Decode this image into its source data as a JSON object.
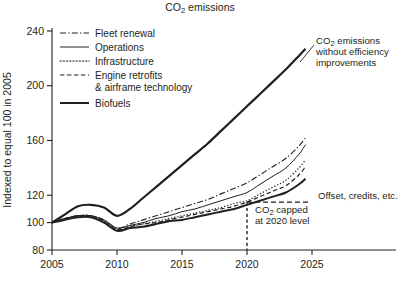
{
  "chart_data": {
    "type": "line",
    "title": "CO2 emissions",
    "title_rich": [
      "CO",
      "2",
      " emissions"
    ],
    "xlabel": "",
    "ylabel": "Indexed to equal 100 in 2005",
    "xlim": [
      2005,
      2025.6
    ],
    "ylim": [
      80,
      243
    ],
    "grid": false,
    "legend_position": "top-left inside plot area",
    "xticks": [
      2005,
      2010,
      2015,
      2020,
      2025
    ],
    "xtick_labels": [
      "2005",
      "2010",
      "2015",
      "2020",
      "2025"
    ],
    "yticks": [
      80,
      100,
      120,
      160,
      200,
      240
    ],
    "ytick_labels": [
      "80",
      "100",
      "120",
      "160",
      "200",
      "240"
    ],
    "x": [
      2005,
      2006,
      2007,
      2008,
      2009,
      2010,
      2011,
      2012,
      2013,
      2014,
      2015,
      2016,
      2017,
      2018,
      2019,
      2020,
      2021,
      2022,
      2023,
      2024,
      2024.5
    ],
    "series": [
      {
        "name": "CO2 emissions without efficiency improvements",
        "short_name": "no-efficiency-baseline",
        "style": "dash-dot-double",
        "width": 2.2,
        "color": "#231f20",
        "values": [
          100,
          106,
          112,
          113,
          111,
          105,
          110,
          118,
          126,
          134,
          142,
          150,
          158,
          167,
          176,
          185,
          194,
          203,
          212,
          222,
          227
        ]
      },
      {
        "name": "Fleet renewal",
        "short_name": "fleet-renewal",
        "style": "dash-dot",
        "width": 1.1,
        "color": "#231f20",
        "values": [
          100,
          103,
          105,
          105,
          102,
          96,
          99,
          102,
          105,
          108,
          111,
          114,
          117,
          121,
          125,
          129,
          135,
          141,
          147,
          156,
          162
        ]
      },
      {
        "name": "Operations",
        "short_name": "operations",
        "style": "solid-thin",
        "width": 1.0,
        "color": "#231f20",
        "values": [
          100,
          103,
          105,
          105,
          102,
          96,
          98,
          100,
          103,
          105,
          108,
          110,
          113,
          116,
          119,
          122,
          128,
          134,
          140,
          150,
          157
        ]
      },
      {
        "name": "Infrastructure",
        "short_name": "infrastructure",
        "style": "dotted",
        "width": 1.2,
        "color": "#231f20",
        "values": [
          100,
          103,
          105,
          105,
          101,
          95,
          97,
          99,
          101,
          103,
          105,
          107,
          109,
          111,
          114,
          116,
          121,
          126,
          131,
          140,
          146
        ]
      },
      {
        "name": "Engine retrofits & airframe technology",
        "short_name": "engine-retrofits",
        "style": "dashed",
        "width": 1.2,
        "color": "#231f20",
        "values": [
          100,
          103,
          105,
          105,
          101,
          95,
          97,
          99,
          100,
          102,
          104,
          106,
          108,
          110,
          112,
          115,
          119,
          123,
          127,
          135,
          141
        ]
      },
      {
        "name": "Biofuels",
        "short_name": "biofuels",
        "style": "solid-thick",
        "width": 2.0,
        "color": "#231f20",
        "values": [
          100,
          102,
          104,
          104,
          100,
          94,
          96,
          97,
          99,
          101,
          102,
          104,
          106,
          108,
          110,
          113,
          116,
          119,
          122,
          128,
          132
        ]
      }
    ],
    "annotations": [
      {
        "id": "no-efficiency-annotation",
        "lines": [
          "CO2 emissions",
          "without efficiency",
          "improvements"
        ],
        "rich_first_line": [
          "CO",
          "2",
          " emissions"
        ],
        "has_leader_line": true
      },
      {
        "id": "offset-credits-annotation",
        "lines": [
          "Offset, credits, etc."
        ],
        "has_leader_line": false,
        "marker": "horizontal dashed line at y=115 from 2020 to 2024.5"
      },
      {
        "id": "co2-cap-annotation",
        "lines": [
          "CO2 capped",
          "at 2020 level"
        ],
        "rich_first_line": [
          "CO",
          "2",
          " capped"
        ],
        "marker": "vertical dashed line at x=2020 from y=80 to y=115"
      }
    ],
    "cap_line": {
      "x": 2020,
      "y": 115,
      "x_end": 2024.5,
      "style": "dashed"
    }
  },
  "legend": {
    "items": [
      {
        "label": "Fleet renewal",
        "style": "dash-dot",
        "series": "fleet-renewal"
      },
      {
        "label": "Operations",
        "style": "solid-thin",
        "series": "operations"
      },
      {
        "label": "Infrastructure",
        "style": "dotted",
        "series": "infrastructure"
      },
      {
        "label": "Engine retrofits",
        "label2": "& airframe technology",
        "style": "dashed",
        "series": "engine-retrofits"
      },
      {
        "label": "Biofuels",
        "style": "solid-thick",
        "series": "biofuels"
      }
    ]
  },
  "colors": {
    "ink": "#231f20",
    "background": "#ffffff"
  }
}
